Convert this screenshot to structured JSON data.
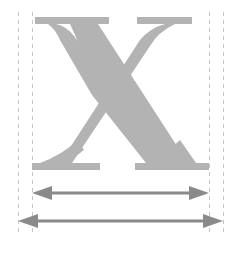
{
  "diagram": {
    "glyph": "X",
    "glyph_color": "#b3b3b3",
    "guide_color": "#bdbdbd",
    "arrow_color": "#8a8a8a",
    "arrows": [
      {
        "name": "bounding-box-width",
        "x1": 32,
        "x2": 209,
        "y": 193
      },
      {
        "name": "advance-width",
        "x1": 18,
        "x2": 223,
        "y": 221
      }
    ],
    "guides": [
      18,
      32,
      209,
      223
    ]
  }
}
